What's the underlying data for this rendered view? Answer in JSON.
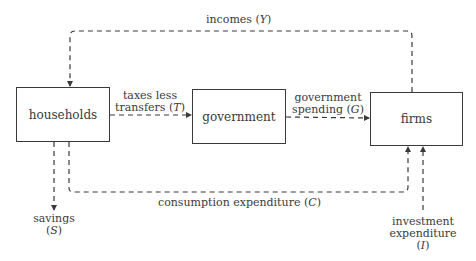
{
  "diagram": {
    "nodes": {
      "households": "households",
      "government": "government",
      "firms": "firms"
    },
    "flows": {
      "incomes": {
        "text": "incomes",
        "symbol": "Y"
      },
      "taxes": {
        "line1": "taxes less",
        "line2": "transfers",
        "symbol": "T"
      },
      "government_spending": {
        "line1": "government",
        "line2": "spending",
        "symbol": "G"
      },
      "consumption": {
        "text": "consumption expenditure",
        "symbol": "C"
      },
      "savings": {
        "text": "savings",
        "symbol": "S"
      },
      "investment": {
        "line1": "investment",
        "line2": "expenditure",
        "symbol": "I"
      }
    },
    "colors": {
      "stroke": "#3a3a3a",
      "background": "#ffffff"
    }
  }
}
